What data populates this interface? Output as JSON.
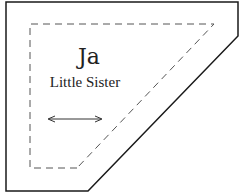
{
  "pattern_piece": {
    "name": "Ja",
    "label": "Little Sister",
    "grainline": "horizontal double-headed arrow",
    "outline": {
      "style": "solid",
      "color": "#1a1a1a"
    },
    "seam_line": {
      "style": "dashed",
      "color": "#555555"
    }
  }
}
